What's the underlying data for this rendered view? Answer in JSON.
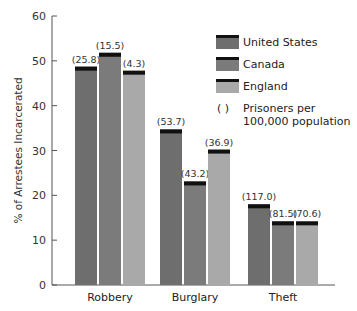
{
  "chart_data": {
    "type": "bar",
    "title": "",
    "xlabel": "",
    "ylabel": "% of Arrestees Incarcerated",
    "ylim": [
      0,
      60
    ],
    "yticks": [
      0,
      10,
      20,
      30,
      40,
      50,
      60
    ],
    "grid": false,
    "legend_position": "upper right",
    "categories": [
      "Robbery",
      "Burglary",
      "Theft"
    ],
    "series": [
      {
        "name": "United States",
        "color": "#6e6e6e",
        "values": [
          48.7,
          34.7,
          18.0
        ],
        "annotations": [
          "(25.8)",
          "(53.7)",
          "(117.0)"
        ]
      },
      {
        "name": "Canada",
        "color": "#7b7b7b",
        "values": [
          51.8,
          23.1,
          14.2
        ],
        "annotations": [
          "(15.5)",
          "(43.2)",
          "(81.5)"
        ]
      },
      {
        "name": "England",
        "color": "#a9a9a9",
        "values": [
          47.8,
          30.2,
          14.2
        ],
        "annotations": [
          "(4.3)",
          "(36.9)",
          "(70.6)"
        ]
      }
    ],
    "legend": [
      {
        "label": "United States",
        "color": "#6e6e6e"
      },
      {
        "label": "Canada",
        "color": "#7b7b7b"
      },
      {
        "label": "England",
        "color": "#a9a9a9"
      }
    ],
    "annotation_note": {
      "symbol": "(      )",
      "line1": "Prisoners per",
      "line2": "100,000 population"
    },
    "bar_cap_color": "#111111"
  }
}
